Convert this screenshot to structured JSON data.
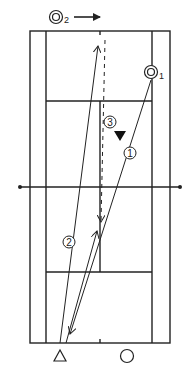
{
  "diagram": {
    "type": "tennis-drill",
    "court": {
      "outer": {
        "x1": 30,
        "y1": 31,
        "x2": 170,
        "y2": 343
      },
      "singles_left_x": 46,
      "singles_right_x": 152,
      "service_line_top_y": 101,
      "service_line_bottom_y": 272,
      "net_y": 187,
      "center_x": 100,
      "line_color": "#222222"
    },
    "players": [
      {
        "id": "p1",
        "symbol": "double-circle",
        "label": "1",
        "x": 151,
        "y": 72
      },
      {
        "id": "p2",
        "symbol": "double-circle",
        "label": "2",
        "x": 56,
        "y": 17
      },
      {
        "id": "feeder",
        "symbol": "triangle",
        "label": "",
        "x": 60,
        "y": 356
      },
      {
        "id": "target",
        "symbol": "circle",
        "label": "",
        "x": 127,
        "y": 356
      }
    ],
    "markers": [
      {
        "id": "cone",
        "symbol": "down-triangle",
        "x": 120,
        "y": 136
      }
    ],
    "shot_labels": [
      {
        "text": "1",
        "x": 130,
        "y": 153
      },
      {
        "text": "2",
        "x": 69,
        "y": 242
      },
      {
        "text": "3",
        "x": 110,
        "y": 122
      }
    ],
    "movement_arrow": {
      "from": [
        74,
        17
      ],
      "to": [
        100,
        17
      ]
    }
  }
}
